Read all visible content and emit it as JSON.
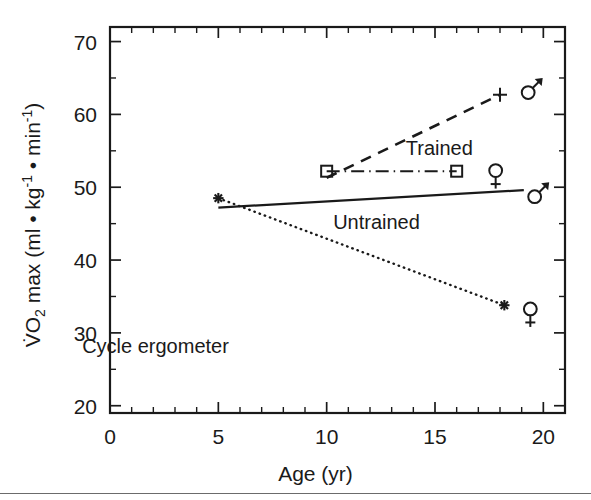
{
  "chart_data": {
    "type": "line",
    "title": "",
    "xlabel": "Age (yr)",
    "ylabel": "VO2 max (ml • kg⁻¹ • min⁻¹)",
    "ylabel_parts": {
      "v_dot": "V̇",
      "o": "O",
      "sub2": "2",
      "max": " max (ml • kg",
      "sup_neg1_a": "-1",
      "mid": " • min",
      "sup_neg1_b": "-1",
      "close": ")"
    },
    "xlim": [
      0,
      21
    ],
    "ylim": [
      19,
      72
    ],
    "x_ticks": [
      0,
      5,
      10,
      15,
      20
    ],
    "x_tick_labels": [
      "0",
      "5",
      "10",
      "15",
      "20"
    ],
    "x_minor_step": 1,
    "y_ticks": [
      20,
      30,
      40,
      50,
      60,
      70
    ],
    "y_tick_labels": [
      "20",
      "30",
      "40",
      "50",
      "60",
      "70"
    ],
    "y_minor_step": 5,
    "grid": false,
    "legend": "none",
    "annotations": [
      {
        "id": "trained",
        "text": "Trained",
        "x": 15.2,
        "y": 54.4
      },
      {
        "id": "untrained",
        "text": "Untrained",
        "x": 12.3,
        "y": 44.2
      },
      {
        "id": "cycle-ergometer",
        "text": "Cycle ergometer",
        "x": 2.1,
        "y": 27.3
      }
    ],
    "series": [
      {
        "name": "Trained males",
        "id": "trained-male",
        "linestyle": "dashed",
        "marker": "plus",
        "sex_symbol": "♂",
        "group": "Trained",
        "x": [
          10.0,
          18.0
        ],
        "y": [
          51.3,
          62.7
        ],
        "endpoint_marker_x": 18.0,
        "endpoint_marker_y": 62.7,
        "sex_symbol_x": 19.3,
        "sex_symbol_y": 63.0
      },
      {
        "name": "Trained females",
        "id": "trained-female",
        "linestyle": "dashdot",
        "marker": "square",
        "sex_symbol": "♀",
        "group": "Trained",
        "x": [
          10.0,
          16.0
        ],
        "y": [
          52.2,
          52.2
        ],
        "markers_x": [
          10.0,
          16.0
        ],
        "markers_y": [
          52.2,
          52.2
        ],
        "sex_symbol_x": 17.8,
        "sex_symbol_y": 51.6
      },
      {
        "name": "Untrained males",
        "id": "untrained-male",
        "linestyle": "solid",
        "marker": "none",
        "sex_symbol": "♂",
        "group": "Untrained",
        "x": [
          5.0,
          19.1
        ],
        "y": [
          47.2,
          49.6
        ],
        "sex_symbol_x": 19.6,
        "sex_symbol_y": 48.7
      },
      {
        "name": "Untrained females",
        "id": "untrained-female",
        "linestyle": "dotted",
        "marker": "asterisk",
        "sex_symbol": "♀",
        "group": "Untrained",
        "x": [
          5.0,
          18.2
        ],
        "y": [
          48.5,
          33.8
        ],
        "markers_x": [
          5.0,
          18.2
        ],
        "markers_y": [
          48.5,
          33.8
        ],
        "sex_symbol_x": 19.4,
        "sex_symbol_y": 32.6
      }
    ]
  }
}
